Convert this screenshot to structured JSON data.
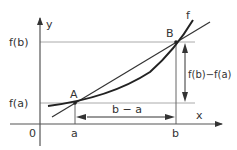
{
  "diagram": {
    "labels": {
      "y_axis": "y",
      "x_axis": "x",
      "origin": "0",
      "fa": "f(a)",
      "fb": "f(b)",
      "a": "a",
      "b": "b",
      "point_a": "A",
      "point_b": "B",
      "curve": "f",
      "horizontal_diff": "b − a",
      "vertical_diff": "f(b)−f(a)"
    },
    "colors": {
      "axis": "#555555",
      "curve": "#222222",
      "secant": "#333333",
      "guide": "#aaaaaa",
      "text": "#333333"
    }
  }
}
